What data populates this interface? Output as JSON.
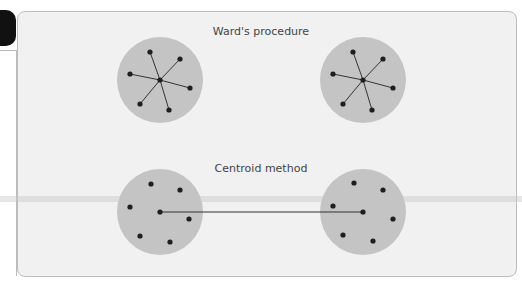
{
  "diagram": {
    "sections": [
      {
        "title": "Ward's procedure",
        "clusters": [
          {
            "cx": 160,
            "cy": 80,
            "r": 43,
            "center": [
              160,
              80
            ],
            "points": [
              [
                150,
                52
              ],
              [
                180,
                59
              ],
              [
                130,
                74
              ],
              [
                190,
                88
              ],
              [
                140,
                104
              ],
              [
                169,
                110
              ]
            ],
            "lines": "star"
          },
          {
            "cx": 363,
            "cy": 80,
            "r": 43,
            "center": [
              363,
              80
            ],
            "points": [
              [
                353,
                52
              ],
              [
                383,
                59
              ],
              [
                333,
                74
              ],
              [
                393,
                88
              ],
              [
                343,
                104
              ],
              [
                372,
                110
              ]
            ],
            "lines": "star"
          }
        ]
      },
      {
        "title": "Centroid method",
        "clusters": [
          {
            "cx": 160,
            "cy": 212,
            "r": 43,
            "center": [
              160,
              212
            ],
            "points": [
              [
                151,
                184
              ],
              [
                180,
                190
              ],
              [
                130,
                207
              ],
              [
                189,
                219
              ],
              [
                140,
                236
              ],
              [
                170,
                242
              ]
            ],
            "lines": "center-link"
          },
          {
            "cx": 363,
            "cy": 212,
            "r": 43,
            "center": [
              363,
              212
            ],
            "points": [
              [
                354,
                183
              ],
              [
                383,
                190
              ],
              [
                333,
                206
              ],
              [
                393,
                219
              ],
              [
                343,
                235
              ],
              [
                373,
                241
              ]
            ],
            "lines": "center-link"
          }
        ],
        "link": {
          "from": [
            160,
            212
          ],
          "to": [
            363,
            212
          ]
        }
      }
    ],
    "colors": {
      "circle_fill": "#c4c4c4",
      "point": "#1e1e1e",
      "line": "#333333",
      "panel_bg": "#f1f1f1"
    }
  }
}
